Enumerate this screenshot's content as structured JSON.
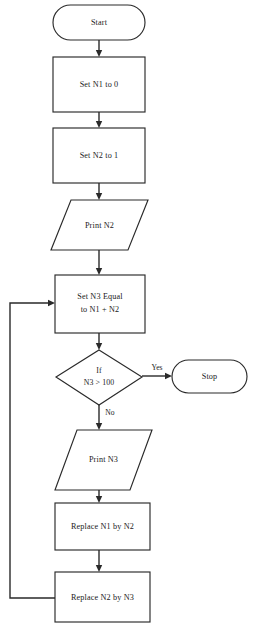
{
  "diagram": {
    "type": "flowchart",
    "background_color": "#ffffff",
    "line_color": "#2a2a2a",
    "fill_color": "#ffffff"
  },
  "nodes": {
    "start": {
      "label": "Start",
      "shape": "terminal"
    },
    "set_n1": {
      "label": "Set N1 to 0",
      "shape": "process"
    },
    "set_n2": {
      "label": "Set N2 to 1",
      "shape": "process"
    },
    "print_n2": {
      "label": "Print N2",
      "shape": "input-output"
    },
    "set_n3": {
      "label_line1": "Set N3 Equal",
      "label_line2": "to N1 + N2",
      "shape": "process"
    },
    "decision": {
      "label_line1": "If",
      "label_line2": "N3 > 100",
      "shape": "decision"
    },
    "stop": {
      "label": "Stop",
      "shape": "terminal"
    },
    "print_n3": {
      "label": "Print N3",
      "shape": "input-output"
    },
    "replace_n1": {
      "label": "Replace N1 by N2",
      "shape": "process"
    },
    "replace_n2": {
      "label": "Replace N2 by N3",
      "shape": "process"
    }
  },
  "edges": {
    "yes_label": "Yes",
    "no_label": "No"
  }
}
